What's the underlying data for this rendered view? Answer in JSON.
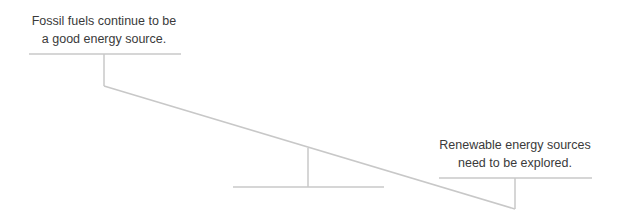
{
  "diagram": {
    "type": "seesaw-balance",
    "left_statement": {
      "line1": "Fossil fuels continue to be",
      "line2": "a good energy source."
    },
    "right_statement": {
      "line1": "Renewable energy sources",
      "line2": "need to be explored."
    },
    "colors": {
      "line": "#c8c8c8",
      "text": "#3a3a3a",
      "background": "#ffffff"
    }
  }
}
